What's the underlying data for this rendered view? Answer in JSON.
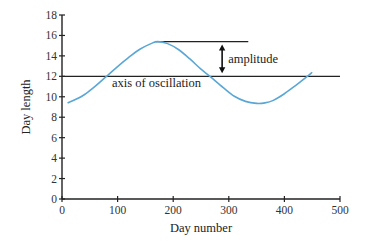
{
  "chart_data": {
    "type": "line",
    "title": "",
    "xlabel": "Day number",
    "ylabel": "Day length",
    "xlim": [
      0,
      500
    ],
    "ylim": [
      0,
      18
    ],
    "xticks": [
      0,
      100,
      200,
      300,
      400,
      500
    ],
    "yticks": [
      0,
      2,
      4,
      6,
      8,
      10,
      12,
      14,
      16,
      18
    ],
    "grid": false,
    "legend": null,
    "series": [
      {
        "name": "Day length",
        "color": "#5aa7d6",
        "x": [
          10,
          25,
          40,
          60,
          80,
          100,
          120,
          140,
          160,
          172,
          190,
          210,
          230,
          250,
          266,
          290,
          310,
          330,
          350,
          365,
          380,
          400,
          420,
          440,
          450
        ],
        "y": [
          9.4,
          9.75,
          10.2,
          11.05,
          12.0,
          12.95,
          13.85,
          14.65,
          15.2,
          15.4,
          15.2,
          14.6,
          13.7,
          12.7,
          12.0,
          10.9,
          10.05,
          9.55,
          9.35,
          9.4,
          9.65,
          10.3,
          11.1,
          11.95,
          12.4
        ]
      }
    ],
    "reference_lines": [
      {
        "name": "axis of oscillation",
        "y": 12,
        "x_from": 0,
        "x_to": 500
      },
      {
        "name": "peak level",
        "y": 15.4,
        "x_from": 172,
        "x_to": 335
      }
    ],
    "annotations": [
      {
        "text": "amplitude",
        "type": "double-arrow",
        "x": 288,
        "y_from": 12,
        "y_to": 15.4
      },
      {
        "text": "axis of oscillation",
        "x": 90,
        "y": 11.0
      }
    ]
  },
  "labels": {
    "xlabel": "Day number",
    "ylabel": "Day length",
    "amplitude": "amplitude",
    "axis_of_oscillation": "axis of oscillation"
  }
}
